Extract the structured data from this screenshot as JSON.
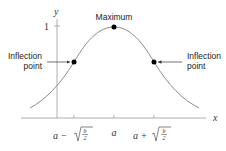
{
  "diagram": {
    "axes": {
      "x_label": "x",
      "y_label": "y",
      "y_tick_label": "1"
    },
    "x_ticks": [
      {
        "id": "left",
        "label_main": "a −",
        "label_sqrt_num": "b",
        "label_sqrt_den": "2"
      },
      {
        "id": "center",
        "label_main": "a"
      },
      {
        "id": "right",
        "label_main": "a +",
        "label_sqrt_num": "b",
        "label_sqrt_den": "2"
      }
    ],
    "annotations": {
      "maximum": "Maximum",
      "left_inflection_line1": "Inflection",
      "left_inflection_line2": "point",
      "right_inflection_line1": "Inflection",
      "right_inflection_line2": "point"
    },
    "colors": {
      "curve": "#8a8a8a",
      "axis": "#9a9a9a",
      "points": "#000000",
      "text": "#222222"
    }
  }
}
